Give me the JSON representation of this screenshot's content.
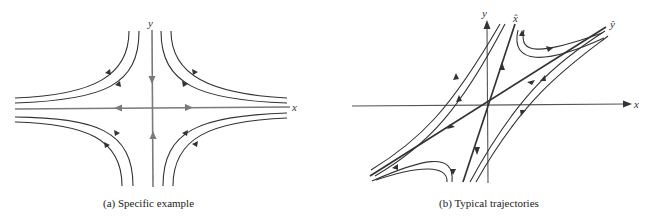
{
  "figures": [
    {
      "id": "a",
      "caption": "(a) Specific example",
      "axis_labels": {
        "x": "x",
        "y": "y"
      },
      "description": "Saddle point: straight-line trajectories along axes, hyperbolic trajectories in each quadrant",
      "colors": {
        "axes": "#777777",
        "trajectories": "#333333"
      }
    },
    {
      "id": "b",
      "caption": "(b) Typical trajectories",
      "axis_labels": {
        "x": "x",
        "y": "y",
        "x_hat": "x̂",
        "y_hat": "ŷ"
      },
      "description": "Saddle point with skewed eigen-directions x̂ and ŷ; trajectories approach along one and depart along the other",
      "colors": {
        "axes": "#555555",
        "trajectories": "#333333"
      }
    }
  ]
}
